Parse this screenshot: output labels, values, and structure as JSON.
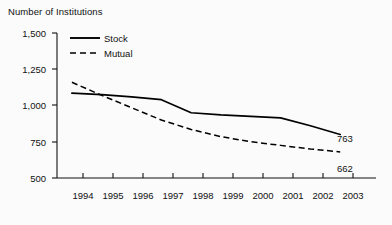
{
  "chart_data": {
    "type": "line",
    "title": "Number of Institutions",
    "xlabel": "",
    "ylabel": "",
    "grid": false,
    "legend_position": "top-left",
    "x": [
      1994,
      1995,
      1996,
      1997,
      1998,
      1999,
      2000,
      2001,
      2002,
      2003
    ],
    "xlim": [
      1993.5,
      2004.2
    ],
    "ylim": [
      500,
      1500
    ],
    "yticks": [
      500,
      750,
      1000,
      1250,
      1500
    ],
    "ytick_labels": [
      "500",
      "750",
      "1,000",
      "1,250",
      "1,500"
    ],
    "xtick_labels": [
      "1994",
      "1995",
      "1996",
      "1997",
      "1998",
      "1999",
      "2000",
      "2001",
      "2002",
      "2003"
    ],
    "series": [
      {
        "name": "Stock",
        "style": "solid",
        "color": "#000000",
        "values": [
          1085,
          1075,
          1060,
          1040,
          950,
          935,
          925,
          915,
          860,
          800
        ],
        "end_label": "763"
      },
      {
        "name": "Mutual",
        "style": "dashed",
        "color": "#000000",
        "values": [
          1160,
          1070,
          985,
          900,
          835,
          785,
          750,
          725,
          700,
          680
        ],
        "end_label": "662"
      }
    ],
    "annotations": [
      {
        "text": "763",
        "series": "Stock"
      },
      {
        "text": "662",
        "series": "Mutual"
      }
    ]
  },
  "legend": {
    "items": [
      {
        "label": "Stock"
      },
      {
        "label": "Mutual"
      }
    ]
  },
  "axis": {
    "y_labels": [
      "1,500",
      "1,250",
      "1,000",
      "750",
      "500"
    ],
    "x_labels": [
      "1994",
      "1995",
      "1996",
      "1997",
      "1998",
      "1999",
      "2000",
      "2001",
      "2002",
      "2003"
    ]
  }
}
